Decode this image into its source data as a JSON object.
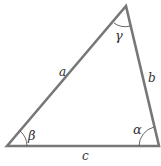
{
  "diagram": {
    "type": "triangle",
    "stroke_color": "#777777",
    "label_color": "#333333",
    "vertices": {
      "bottom_left": {
        "x": 7,
        "y": 146,
        "angle_label": "β"
      },
      "top": {
        "x": 126,
        "y": 6,
        "angle_label": "γ"
      },
      "bottom_right": {
        "x": 159,
        "y": 146,
        "angle_label": "α"
      }
    },
    "sides": {
      "left": {
        "label": "a"
      },
      "right": {
        "label": "b"
      },
      "bottom": {
        "label": "c"
      }
    }
  }
}
